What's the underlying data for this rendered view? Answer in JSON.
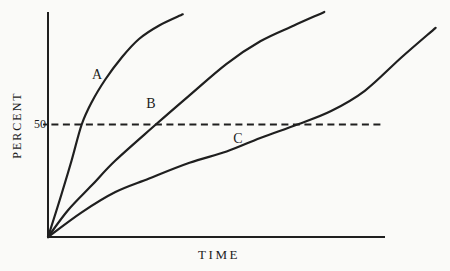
{
  "figure": {
    "background": "#fafaf8",
    "ink": "#1f1f1f",
    "ylabel": "PERCENT",
    "xlabel": "TIME",
    "ylabel_pos": {
      "x": 17,
      "y": 125
    },
    "xlabel_pos": {
      "x": 219,
      "y": 254
    },
    "tick50": {
      "text": "50",
      "pos": {
        "x": 40,
        "y": 124
      }
    },
    "curve_labels": [
      {
        "text": "A",
        "pos": {
          "x": 97,
          "y": 75
        }
      },
      {
        "text": "B",
        "pos": {
          "x": 151,
          "y": 104
        }
      },
      {
        "text": "C",
        "pos": {
          "x": 238,
          "y": 139
        }
      }
    ],
    "plot": {
      "origin_x": 48,
      "origin_y": 237,
      "top_y": 12,
      "right_x": 385
    }
  },
  "chart_data": {
    "type": "line",
    "title": "",
    "xlabel": "TIME",
    "ylabel": "PERCENT",
    "xlim": [
      0,
      100
    ],
    "ylim": [
      0,
      100
    ],
    "xticks": [],
    "yticks": [
      {
        "value": 50,
        "label": "50"
      }
    ],
    "grid": false,
    "legend": "inline-curve-labels",
    "reference_line": {
      "y": 50,
      "style": "dashed",
      "from_x": 1,
      "to_x": 99.5
    },
    "series": [
      {
        "name": "A",
        "points": [
          [
            0,
            0
          ],
          [
            4,
            19
          ],
          [
            7,
            34
          ],
          [
            10,
            50
          ],
          [
            13,
            60
          ],
          [
            17,
            70
          ],
          [
            22,
            80
          ],
          [
            27,
            88
          ],
          [
            33,
            94
          ],
          [
            40,
            99
          ]
        ]
      },
      {
        "name": "B",
        "points": [
          [
            0,
            0
          ],
          [
            6,
            12
          ],
          [
            13,
            23
          ],
          [
            20,
            34
          ],
          [
            32,
            50
          ],
          [
            42,
            63
          ],
          [
            53,
            77
          ],
          [
            63,
            87
          ],
          [
            73,
            94
          ],
          [
            82,
            100
          ]
        ]
      },
      {
        "name": "C",
        "points": [
          [
            0,
            0
          ],
          [
            10,
            11
          ],
          [
            20,
            20
          ],
          [
            30,
            26
          ],
          [
            42,
            33
          ],
          [
            53,
            38
          ],
          [
            63,
            44
          ],
          [
            74,
            50
          ],
          [
            84,
            56
          ],
          [
            94,
            65
          ],
          [
            105,
            80
          ],
          [
            115,
            93
          ]
        ]
      }
    ]
  }
}
